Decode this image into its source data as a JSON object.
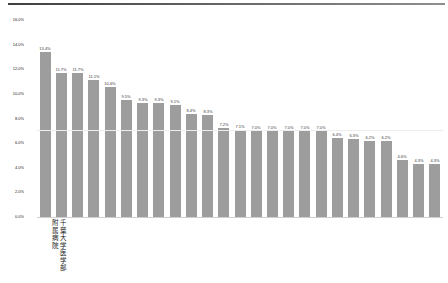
{
  "page": {
    "background": "#ffffff",
    "top_border_colors": [
      "#3f3f3f",
      "#8f8f8f"
    ]
  },
  "chart_data": {
    "type": "bar",
    "title": "",
    "xlabel": "",
    "ylabel": "",
    "unit": "%",
    "ylim": [
      0,
      16
    ],
    "grid": false,
    "legend": null,
    "yticks": [
      {
        "value": 16,
        "label": "16.0%"
      },
      {
        "value": 14,
        "label": "14.0%"
      },
      {
        "value": 12,
        "label": "12.0%"
      },
      {
        "value": 10,
        "label": "10.0%"
      },
      {
        "value": 8,
        "label": "8.0%"
      },
      {
        "value": 6,
        "label": "6.0%"
      },
      {
        "value": 4,
        "label": "4.0%"
      },
      {
        "value": 2,
        "label": "2.0%"
      },
      {
        "value": 0,
        "label": "0.0%"
      }
    ],
    "reference_line": {
      "value": 7.0,
      "color": "#ededed"
    },
    "colors": {
      "bar": "#9d9d9d",
      "value_label": "#3a3a3a",
      "axis_line": "#cfcfcf"
    },
    "bars": [
      {
        "value": 13.4,
        "label": "13.4%",
        "category": ""
      },
      {
        "value": 11.7,
        "label": "11.7%",
        "category": "千葉大学医学部附属病院"
      },
      {
        "value": 11.7,
        "label": "11.7%",
        "category": ""
      },
      {
        "value": 11.1,
        "label": "11.1%",
        "category": ""
      },
      {
        "value": 10.6,
        "label": "10.6%",
        "category": ""
      },
      {
        "value": 9.5,
        "label": "9.5%",
        "category": ""
      },
      {
        "value": 9.3,
        "label": "9.3%",
        "category": ""
      },
      {
        "value": 9.3,
        "label": "9.3%",
        "category": ""
      },
      {
        "value": 9.1,
        "label": "9.1%",
        "category": ""
      },
      {
        "value": 8.4,
        "label": "8.4%",
        "category": ""
      },
      {
        "value": 8.3,
        "label": "8.3%",
        "category": ""
      },
      {
        "value": 7.2,
        "label": "7.2%",
        "category": ""
      },
      {
        "value": 7.1,
        "label": "7.1%",
        "category": ""
      },
      {
        "value": 7.0,
        "label": "7.0%",
        "category": ""
      },
      {
        "value": 7.0,
        "label": "7.0%",
        "category": ""
      },
      {
        "value": 7.0,
        "label": "7.0%",
        "category": ""
      },
      {
        "value": 7.0,
        "label": "7.0%",
        "category": ""
      },
      {
        "value": 7.0,
        "label": "7.0%",
        "category": ""
      },
      {
        "value": 6.4,
        "label": "6.4%",
        "category": ""
      },
      {
        "value": 6.3,
        "label": "6.3%",
        "category": ""
      },
      {
        "value": 6.2,
        "label": "6.2%",
        "category": ""
      },
      {
        "value": 6.2,
        "label": "6.2%",
        "category": ""
      },
      {
        "value": 4.6,
        "label": "4.6%",
        "category": ""
      },
      {
        "value": 4.3,
        "label": "4.3%",
        "category": ""
      },
      {
        "value": 4.3,
        "label": "4.3%",
        "category": ""
      }
    ]
  }
}
